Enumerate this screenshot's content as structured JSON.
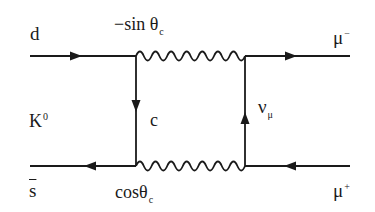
{
  "diagram": {
    "type": "feynman-box",
    "line_color": "#1a1a1a",
    "background": "#ffffff",
    "labels": {
      "d": "d",
      "top_coupling_prefix": "−sin θ",
      "top_coupling_sub": "c",
      "mu_minus_base": "μ",
      "mu_minus_sup": "−",
      "kaon_base": "K",
      "kaon_sup": "0",
      "charm": "c",
      "neutrino_base": "ν",
      "neutrino_sub": "μ",
      "sbar": "s",
      "bottom_coupling_prefix": "cosθ",
      "bottom_coupling_sub": "c",
      "mu_plus_base": "μ",
      "mu_plus_sup": "+"
    },
    "propagators": [
      {
        "name": "d-quark-in",
        "kind": "fermion",
        "from": [
          30,
          56
        ],
        "to": [
          136,
          56
        ],
        "arrow": "right"
      },
      {
        "name": "W-top",
        "kind": "boson-wavy",
        "from": [
          136,
          56
        ],
        "to": [
          245,
          56
        ]
      },
      {
        "name": "mu-minus-out",
        "kind": "fermion",
        "from": [
          245,
          56
        ],
        "to": [
          350,
          56
        ],
        "arrow": "right"
      },
      {
        "name": "charm-internal",
        "kind": "fermion",
        "from": [
          136,
          56
        ],
        "to": [
          136,
          166
        ],
        "arrow": "down"
      },
      {
        "name": "neutrino-internal",
        "kind": "fermion",
        "from": [
          245,
          166
        ],
        "to": [
          245,
          56
        ],
        "arrow": "up"
      },
      {
        "name": "sbar-quark",
        "kind": "fermion",
        "from": [
          136,
          166
        ],
        "to": [
          30,
          166
        ],
        "arrow": "left"
      },
      {
        "name": "W-bottom",
        "kind": "boson-wavy",
        "from": [
          136,
          166
        ],
        "to": [
          245,
          166
        ]
      },
      {
        "name": "mu-plus-line",
        "kind": "fermion",
        "from": [
          350,
          166
        ],
        "to": [
          245,
          166
        ],
        "arrow": "left"
      }
    ]
  }
}
